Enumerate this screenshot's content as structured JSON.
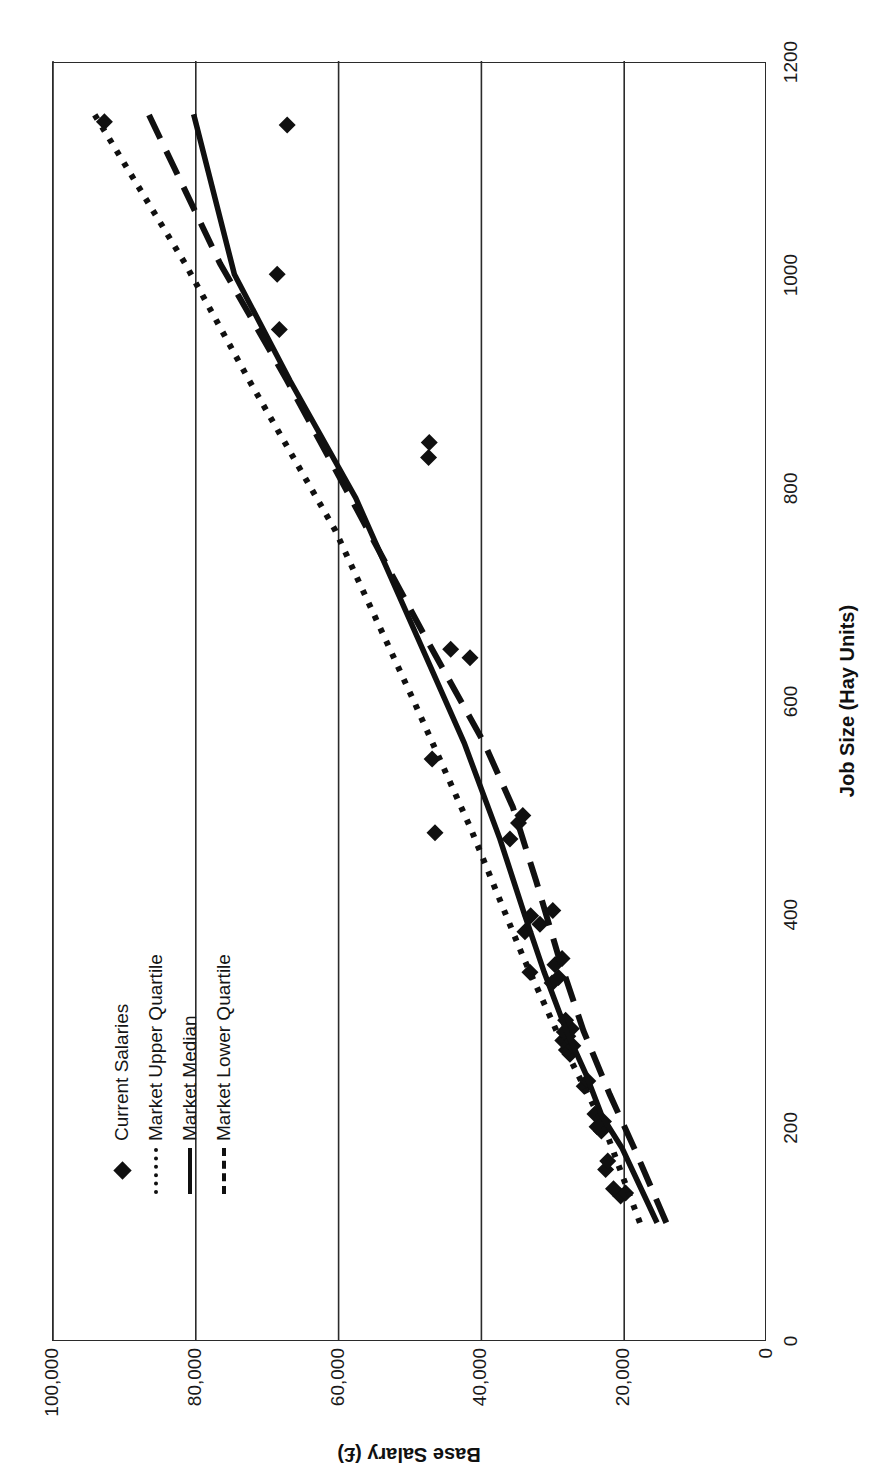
{
  "figure": {
    "orientation": "rotated-90-ccw",
    "background": "#ffffff",
    "ink_color": "#101010"
  },
  "legend": {
    "position": "top-left-inside-plot",
    "items": [
      {
        "label": "Current Salaries",
        "marker": "diamond-marker",
        "style": "marker"
      },
      {
        "label": "Market Upper Quartile",
        "marker": "dotted-line-key",
        "style": "dotted"
      },
      {
        "label": "Market Median",
        "marker": "solid-line-key",
        "style": "solid"
      },
      {
        "label": "Market Lower Quartile",
        "marker": "dashed-line-key",
        "style": "dashed"
      }
    ]
  },
  "chart_data": {
    "type": "scatter",
    "title": "",
    "xlabel": "Job Size (Hay Units)",
    "ylabel": "Base Salary (£)",
    "xlim": [
      0,
      1200
    ],
    "ylim": [
      0,
      100000
    ],
    "xticks": [
      0,
      200,
      400,
      600,
      800,
      1000,
      1200
    ],
    "xtick_labels": [
      "0",
      "200",
      "400",
      "600",
      "800",
      "1000",
      "1200"
    ],
    "yticks": [
      0,
      20000,
      40000,
      60000,
      80000,
      100000
    ],
    "ytick_labels": [
      "0",
      "20,000",
      "40,000",
      "60,000",
      "80,000",
      "100,000"
    ],
    "grid": "vertical gridlines at each salary tick",
    "legend_position": "upper left",
    "series": [
      {
        "name": "Current Salaries",
        "style": "marker",
        "marker": "diamond",
        "points": [
          [
            135,
            20500
          ],
          [
            138,
            19800
          ],
          [
            142,
            21500
          ],
          [
            160,
            22600
          ],
          [
            168,
            22300
          ],
          [
            196,
            23200
          ],
          [
            200,
            23800
          ],
          [
            205,
            22900
          ],
          [
            212,
            24100
          ],
          [
            238,
            25600
          ],
          [
            243,
            25100
          ],
          [
            268,
            27600
          ],
          [
            272,
            28100
          ],
          [
            276,
            27200
          ],
          [
            281,
            28600
          ],
          [
            285,
            27900
          ],
          [
            289,
            28400
          ],
          [
            292,
            27400
          ],
          [
            300,
            28200
          ],
          [
            335,
            30100
          ],
          [
            340,
            29200
          ],
          [
            345,
            33200
          ],
          [
            352,
            29700
          ],
          [
            358,
            28700
          ],
          [
            383,
            33900
          ],
          [
            390,
            31800
          ],
          [
            398,
            33100
          ],
          [
            403,
            30000
          ],
          [
            470,
            36000
          ],
          [
            476,
            46500
          ],
          [
            485,
            34800
          ],
          [
            492,
            34200
          ],
          [
            545,
            46900
          ],
          [
            640,
            41600
          ],
          [
            648,
            44300
          ],
          [
            828,
            47400
          ],
          [
            842,
            47300
          ],
          [
            948,
            68300
          ],
          [
            1000,
            68600
          ],
          [
            1140,
            67200
          ],
          [
            1143,
            92800
          ]
        ]
      },
      {
        "name": "Market Upper Quartile",
        "style": "dotted",
        "points": [
          [
            110,
            17800
          ],
          [
            200,
            22800
          ],
          [
            280,
            28800
          ],
          [
            360,
            34200
          ],
          [
            480,
            41500
          ],
          [
            600,
            49500
          ],
          [
            760,
            60500
          ],
          [
            900,
            72500
          ],
          [
            1010,
            81500
          ],
          [
            1150,
            94200
          ]
        ]
      },
      {
        "name": "Market Median",
        "style": "solid",
        "points": [
          [
            110,
            15400
          ],
          [
            180,
            20300
          ],
          [
            210,
            23100
          ],
          [
            250,
            25400
          ],
          [
            290,
            28100
          ],
          [
            345,
            31200
          ],
          [
            400,
            34000
          ],
          [
            470,
            37400
          ],
          [
            560,
            42400
          ],
          [
            660,
            49000
          ],
          [
            790,
            57600
          ],
          [
            900,
            66800
          ],
          [
            1000,
            74600
          ],
          [
            1150,
            80300
          ]
        ]
      },
      {
        "name": "Market Lower Quartile",
        "style": "dashed",
        "points": [
          [
            110,
            14100
          ],
          [
            180,
            18600
          ],
          [
            230,
            22000
          ],
          [
            290,
            25700
          ],
          [
            360,
            29200
          ],
          [
            430,
            32300
          ],
          [
            500,
            35600
          ],
          [
            560,
            39600
          ],
          [
            660,
            47900
          ],
          [
            780,
            57500
          ],
          [
            900,
            67200
          ],
          [
            1010,
            76600
          ],
          [
            1150,
            86600
          ]
        ]
      }
    ]
  }
}
